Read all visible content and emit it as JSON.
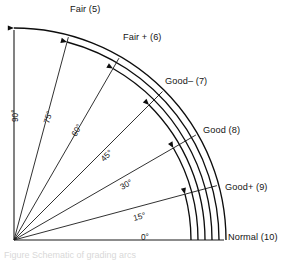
{
  "figure": {
    "origin_label": "vertex",
    "caption_partial": "Figure  Schematic of grading arcs"
  },
  "grades": [
    {
      "id": "fair",
      "label": "Fair (5)",
      "angle_deg": 90,
      "score": 5,
      "label_x": 70,
      "label_y": 12
    },
    {
      "id": "fairplus",
      "label": "Fair + (6)",
      "angle_deg": 75,
      "score": 6,
      "label_x": 123,
      "label_y": 40
    },
    {
      "id": "goodminus",
      "label": "Good– (7)",
      "angle_deg": 60,
      "score": 7,
      "label_x": 165,
      "label_y": 84
    },
    {
      "id": "good",
      "label": "Good (8)",
      "angle_deg": 45,
      "score": 8,
      "label_x": 203,
      "label_y": 133
    },
    {
      "id": "goodplus",
      "label": "Good+ (9)",
      "angle_deg": 30,
      "score": 9,
      "label_x": 225,
      "label_y": 190
    },
    {
      "id": "normal",
      "label": "Normal (10)",
      "angle_deg": 15,
      "score": 10,
      "label_x": 228,
      "label_y": 240
    }
  ],
  "angles": [
    {
      "id": "a90",
      "label": "90°",
      "deg": 90,
      "x": 18,
      "y": 122,
      "rotate": -90
    },
    {
      "id": "a75",
      "label": "75°",
      "deg": 75,
      "x": 49,
      "y": 124,
      "rotate": -74
    },
    {
      "id": "a60",
      "label": "60°",
      "deg": 60,
      "x": 76,
      "y": 137,
      "rotate": -60
    },
    {
      "id": "a45",
      "label": "45°",
      "deg": 45,
      "x": 104,
      "y": 162,
      "rotate": -44
    },
    {
      "id": "a30",
      "label": "30°",
      "deg": 30,
      "x": 122,
      "y": 190,
      "rotate": -29
    },
    {
      "id": "a15",
      "label": "15°",
      "deg": 15,
      "x": 134,
      "y": 221,
      "rotate": -15
    },
    {
      "id": "a0",
      "label": "0°",
      "deg": 0,
      "x": 141,
      "y": 240,
      "rotate": 0
    }
  ],
  "geometry": {
    "origin_x": 14,
    "origin_y": 240,
    "ray_radius": 210,
    "arc_radii": [
      212,
      205,
      198,
      191,
      184,
      177
    ],
    "arc_end_angles": [
      90,
      75,
      60,
      45,
      30,
      15
    ],
    "stroke_color": "#0d0d0d",
    "background": "#ffffff"
  }
}
